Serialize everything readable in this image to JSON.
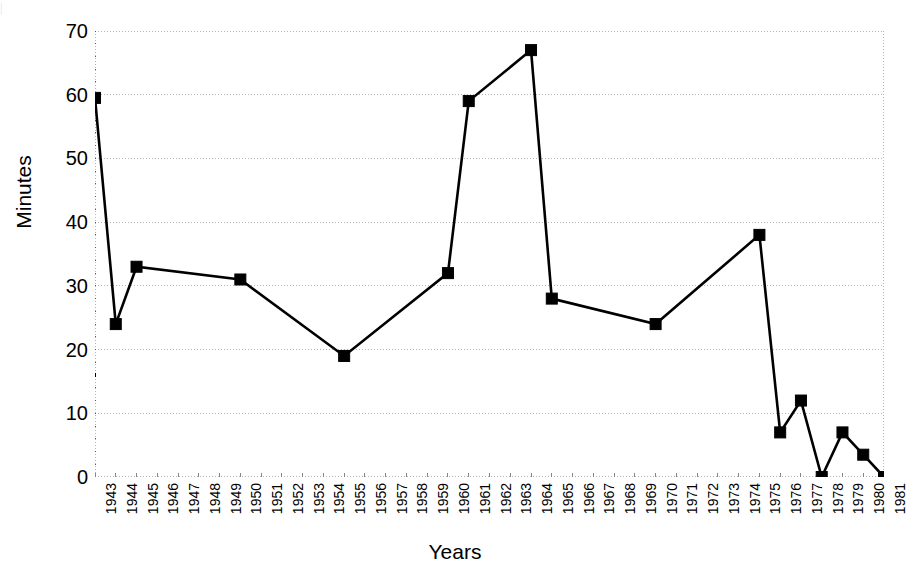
{
  "chart_data": {
    "type": "line",
    "title": "",
    "xlabel": "Years",
    "ylabel": "Minutes",
    "categories": [
      "1943",
      "1944",
      "1945",
      "1946",
      "1947",
      "1948",
      "1949",
      "1950",
      "1951",
      "1952",
      "1953",
      "1954",
      "1955",
      "1956",
      "1957",
      "1958",
      "1959",
      "1960",
      "1961",
      "1962",
      "1963",
      "1964",
      "1965",
      "1966",
      "1967",
      "1968",
      "1969",
      "1970",
      "1971",
      "1972",
      "1973",
      "1974",
      "1975",
      "1976",
      "1977",
      "1978",
      "1979",
      "1980",
      "1981"
    ],
    "x_tick_labels": [
      "1943",
      "1944",
      "1945",
      "1946",
      "1947",
      "1948",
      "1949",
      "1950",
      "1951",
      "1952",
      "1953",
      "1954",
      "1955",
      "1956",
      "1957",
      "1958",
      "1959",
      "1960",
      "1961",
      "1962",
      "1963",
      "1964",
      "1965",
      "1966",
      "1967",
      "1968",
      "1969",
      "1970",
      "1971",
      "1972",
      "1973",
      "1974",
      "1975",
      "1976",
      "1977",
      "1978",
      "1979",
      "1980",
      "1981"
    ],
    "y_tick_labels": [
      "0",
      "10",
      "20",
      "30",
      "40",
      "50",
      "60",
      "70"
    ],
    "y_ticks": [
      0,
      10,
      20,
      30,
      40,
      50,
      60,
      70
    ],
    "ylim": [
      0,
      70
    ],
    "xlim_categories": [
      0,
      38
    ],
    "grid": "horizontal-dotted",
    "legend": "none",
    "marker": "filled-square",
    "line_color": "#000000",
    "marker_color": "#000000",
    "grid_color": "#b4b4b4",
    "axis_color": "#555555",
    "series": [
      {
        "name": "Minutes",
        "points": [
          {
            "x": "1943",
            "y": 59.5
          },
          {
            "x": "1944",
            "y": 24
          },
          {
            "x": "1945",
            "y": 33
          },
          {
            "x": "1950",
            "y": 31
          },
          {
            "x": "1955",
            "y": 19
          },
          {
            "x": "1960",
            "y": 32
          },
          {
            "x": "1961",
            "y": 59
          },
          {
            "x": "1964",
            "y": 67
          },
          {
            "x": "1965",
            "y": 28
          },
          {
            "x": "1970",
            "y": 24
          },
          {
            "x": "1975",
            "y": 38
          },
          {
            "x": "1976",
            "y": 7
          },
          {
            "x": "1977",
            "y": 12
          },
          {
            "x": "1978",
            "y": 0
          },
          {
            "x": "1979",
            "y": 7
          },
          {
            "x": "1980",
            "y": 3.5
          },
          {
            "x": "1981",
            "y": 0
          }
        ]
      }
    ],
    "stray_tick_value": 16,
    "scan_artifact_text": "|"
  }
}
